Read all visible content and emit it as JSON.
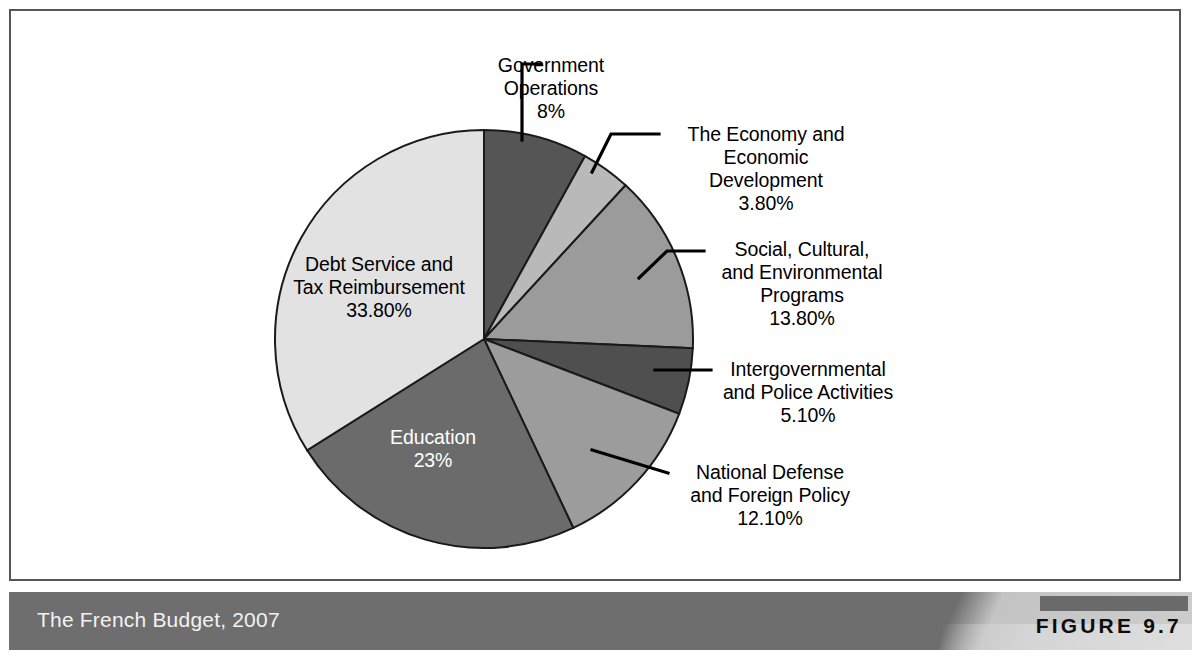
{
  "figure": {
    "caption": "The French Budget, 2007",
    "number": "FIGURE 9.7"
  },
  "colors": {
    "slice_government_operations": "#555555",
    "slice_economy": "#b9b9b9",
    "slice_social_cultural": "#9b9b9b",
    "slice_intergovernmental": "#4f4f4f",
    "slice_national_defense": "#9c9c9c",
    "slice_education": "#6b6b6b",
    "slice_debt_service": "#e2e2e2",
    "slice_outline": "#1a1a1a",
    "caption_bar": "#6e6e6e",
    "frame_border": "#565656",
    "label_text": "#000000",
    "inside_label_text": "#ffffff"
  },
  "chart_data": {
    "type": "pie",
    "title": "The French Budget, 2007",
    "xlabel": "",
    "ylabel": "",
    "legend": "none",
    "grid": false,
    "start_angle_deg": -90,
    "direction": "clockwise",
    "categories": [
      "Government Operations",
      "The Economy and Economic Development",
      "Social, Cultural, and Environmental Programs",
      "Intergovernmental and Police Activities",
      "National Defense and Foreign Policy",
      "Education",
      "Debt Service and Tax Reimbursement"
    ],
    "values": [
      8,
      3.8,
      13.8,
      5.1,
      12.1,
      23,
      33.8
    ],
    "value_labels": [
      "8%",
      "3.80%",
      "13.80%",
      "5.10%",
      "12.10%",
      "23%",
      "33.80%"
    ],
    "units": "percent"
  },
  "slices": [
    {
      "id": "government-operations",
      "name_lines": [
        "Government",
        "Operations"
      ],
      "value_label": "8%",
      "value": 8,
      "label_placement": "outside",
      "label_x": 529,
      "label_y": 32,
      "color": "#555555"
    },
    {
      "id": "economy-development",
      "name_lines": [
        "The Economy and",
        "Economic",
        "Development"
      ],
      "value_label": "3.80%",
      "value": 3.8,
      "label_placement": "outside",
      "label_x": 650,
      "label_y": 101,
      "color": "#b9b9b9"
    },
    {
      "id": "social-cultural-environmental",
      "name_lines": [
        "Social, Cultural,",
        "and Environmental",
        "Programs"
      ],
      "value_label": "13.80%",
      "value": 13.8,
      "label_placement": "outside",
      "label_x": 694,
      "label_y": 216,
      "color": "#9b9b9b"
    },
    {
      "id": "intergovernmental-police",
      "name_lines": [
        "Intergovernmental",
        "and Police Activities"
      ],
      "value_label": "5.10%",
      "value": 5.1,
      "label_placement": "outside",
      "label_x": 700,
      "label_y": 341,
      "color": "#4f4f4f"
    },
    {
      "id": "national-defense-foreign-policy",
      "name_lines": [
        "National Defense",
        "and Foreign Policy"
      ],
      "value_label": "12.10%",
      "value": 12.1,
      "label_placement": "outside",
      "label_x": 657,
      "label_y": 444,
      "color": "#9c9c9c"
    },
    {
      "id": "education",
      "name_lines": [
        "Education"
      ],
      "value_label": "23%",
      "value": 23,
      "label_placement": "inside",
      "label_x": 370,
      "label_y": 412,
      "color": "#6b6b6b"
    },
    {
      "id": "debt-service-tax-reimbursement",
      "name_lines": [
        "Debt Service and",
        "Tax Reimbursement"
      ],
      "value_label": "33.80%",
      "value": 33.8,
      "label_placement": "inside",
      "label_x": 278,
      "label_y": 238,
      "color": "#e2e2e2"
    }
  ],
  "pie_geometry": {
    "center_x": 473,
    "center_y": 328,
    "radius": 209
  }
}
